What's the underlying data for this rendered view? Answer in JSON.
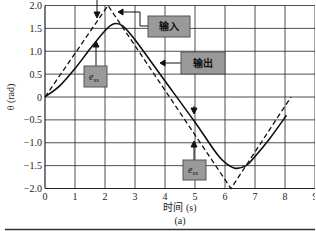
{
  "chart_data": {
    "type": "line",
    "title": "",
    "subtitle": "(a)",
    "xlabel": "时间 (s)",
    "ylabel": "θ (rad)",
    "xlim": [
      0,
      9
    ],
    "ylim": [
      -2.0,
      2.0
    ],
    "grid": true,
    "x_ticks": [
      "0",
      "1",
      "2",
      "3",
      "4",
      "5",
      "6",
      "7",
      "8",
      "9"
    ],
    "y_ticks": [
      "2.0",
      "1.5",
      "1.0",
      "0.5",
      "0",
      "-0.5",
      "-1.0",
      "-1.5",
      "-2.0"
    ],
    "series": [
      {
        "name": "输入",
        "style": "dashed",
        "x": [
          0,
          2.1,
          6.2,
          8.2
        ],
        "y": [
          0,
          2.0,
          -2.0,
          0.0
        ]
      },
      {
        "name": "输出",
        "style": "solid",
        "x": [
          0,
          0.5,
          1.0,
          1.5,
          2.0,
          2.3,
          2.6,
          3.0,
          4.0,
          5.0,
          5.8,
          6.3,
          6.7,
          7.0,
          7.5,
          8.05
        ],
        "y": [
          0,
          0.25,
          0.62,
          1.05,
          1.45,
          1.6,
          1.55,
          1.25,
          0.35,
          -0.55,
          -1.3,
          -1.55,
          -1.5,
          -1.3,
          -0.9,
          -0.4
        ]
      }
    ],
    "annotations": [
      {
        "label": "输入",
        "points_to": "dashed input curve"
      },
      {
        "label": "输出",
        "points_to": "solid output curve"
      },
      {
        "label": "e_ss",
        "points_to": "steady-state error on rising ramp"
      },
      {
        "label": "e_ss",
        "points_to": "steady-state error on falling ramp"
      }
    ]
  },
  "labels": {
    "input": "输入",
    "output": "输出",
    "ess_main": "e",
    "ess_sub": "ss",
    "xlabel": "时间 (s)",
    "ylabel": "θ (rad)",
    "caption": "(a)"
  },
  "style": {
    "line_color": "#111111",
    "grid_color": "#222222",
    "box_fill": "#9a9a9a",
    "box_stroke": "#555555"
  }
}
